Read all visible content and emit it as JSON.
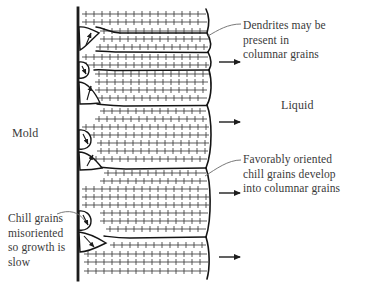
{
  "figure": {
    "background_color": "#ffffff",
    "line_color": "#1d1d1d",
    "text_color": "#3a3a3a"
  },
  "labels": {
    "mold": "Mold",
    "liquid": "Liquid",
    "dendrites": "Dendrites may be\npresent in\ncolumnar grains",
    "favorably": "Favorably oriented\nchill grains develop\ninto columnar grains",
    "chill": "Chill grains\nmisoriented\nso growth is\nslow"
  },
  "diagram": {
    "mold_wall": {
      "x": 78,
      "y_top": 8,
      "y_bottom": 280,
      "thickness": 2.6
    },
    "solidification_front": {
      "description": "wavy vertical boundary between solid columnar grains and liquid",
      "x_mean": 210,
      "amplitude": 6
    },
    "growth_arrows": [
      {
        "x": 219,
        "y": 63,
        "length": 22,
        "direction": "right"
      },
      {
        "x": 219,
        "y": 122,
        "length": 22,
        "direction": "right"
      },
      {
        "x": 219,
        "y": 194,
        "length": 22,
        "direction": "right"
      },
      {
        "x": 219,
        "y": 258,
        "length": 22,
        "direction": "right"
      }
    ],
    "chill_grains": [
      {
        "cx": 88,
        "cy": 41,
        "arrow_angle_deg": -65,
        "label": "favorably-oriented"
      },
      {
        "cx": 87,
        "cy": 70,
        "arrow_angle_deg": 20,
        "label": "misoriented-small"
      },
      {
        "cx": 89,
        "cy": 93,
        "arrow_angle_deg": -80,
        "label": "favorably-oriented"
      },
      {
        "cx": 88,
        "cy": 139,
        "arrow_angle_deg": 25,
        "label": "misoriented-small"
      },
      {
        "cx": 90,
        "cy": 163,
        "arrow_angle_deg": -55,
        "label": "favorably-oriented"
      },
      {
        "cx": 88,
        "cy": 220,
        "arrow_angle_deg": 30,
        "label": "misoriented-small"
      },
      {
        "cx": 91,
        "cy": 243,
        "arrow_angle_deg": 40,
        "label": "misoriented-wedge"
      }
    ],
    "dendrite_rows": {
      "count": 34,
      "description": "horizontal dendrite trunks with perpendicular side-branch ticks",
      "tick_spacing": 4,
      "row_spacing": 8
    },
    "grain_boundaries": [
      {
        "y": 50
      },
      {
        "y": 105
      },
      {
        "y": 170
      },
      {
        "y": 238
      }
    ]
  },
  "leader_lines": [
    {
      "name": "dendrites-leader",
      "from_x": 240,
      "from_y": 24,
      "to_x": 207,
      "to_y": 36
    },
    {
      "name": "favorably-leader",
      "from_x": 240,
      "from_y": 160,
      "to_x": 205,
      "to_y": 176
    },
    {
      "name": "chill-leader",
      "from_x": 60,
      "from_y": 215,
      "to_x": 84,
      "to_y": 222
    }
  ]
}
